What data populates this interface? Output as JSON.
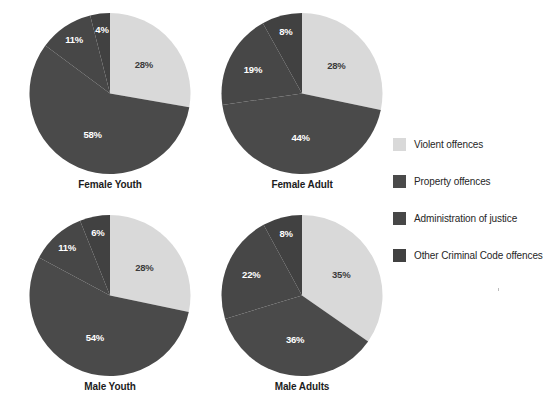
{
  "chart_data": {
    "type": "pie",
    "title": "",
    "subtitle": "",
    "xlabel": "",
    "ylabel": "",
    "grid": false,
    "legend_position": "right",
    "value_suffix": "%",
    "start_angle_deg": 0,
    "direction": "clockwise",
    "categories": [
      "Violent offences",
      "Property offences",
      "Administration of justice",
      "Other Criminal Code offences"
    ],
    "category_colors": [
      "#d9d9d9",
      "#4a4a4a",
      "#474747",
      "#414141"
    ],
    "charts": [
      {
        "title": "Female Youth",
        "labels": [
          "28%",
          "58%",
          "11%",
          "4%"
        ],
        "values": [
          28,
          58,
          11,
          4
        ]
      },
      {
        "title": "Female Adult",
        "labels": [
          "28%",
          "44%",
          "19%",
          "8%"
        ],
        "values": [
          28,
          44,
          19,
          8
        ]
      },
      {
        "title": "Male Youth",
        "labels": [
          "28%",
          "54%",
          "11%",
          "6%"
        ],
        "values": [
          28,
          54,
          11,
          6
        ]
      },
      {
        "title": "Male Adults",
        "labels": [
          "35%",
          "36%",
          "22%",
          "8%"
        ],
        "values": [
          35,
          36,
          22,
          8
        ]
      }
    ]
  },
  "legend": {
    "items": [
      {
        "label": "Violent offences",
        "color": "#d9d9d9"
      },
      {
        "label": "Property offences",
        "color": "#4a4a4a"
      },
      {
        "label": "Administration of justice",
        "color": "#474747"
      },
      {
        "label": "Other Criminal Code offences",
        "color": "#414141"
      }
    ]
  }
}
